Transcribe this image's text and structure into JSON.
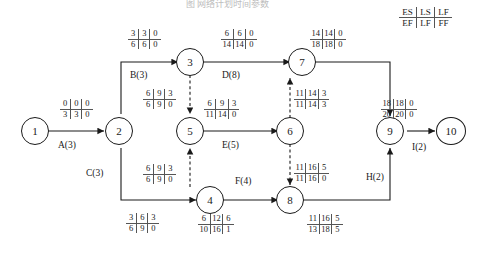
{
  "title": "图 网络计划时间参数",
  "legend": {
    "name": "time-parameter-legend",
    "top": [
      "ES",
      "LS",
      "LF"
    ],
    "bottom": [
      "EF",
      "LF",
      "FF"
    ]
  },
  "nodes": [
    {
      "id": "1",
      "label": "1"
    },
    {
      "id": "2",
      "label": "2"
    },
    {
      "id": "3",
      "label": "3"
    },
    {
      "id": "4",
      "label": "4"
    },
    {
      "id": "5",
      "label": "5"
    },
    {
      "id": "6",
      "label": "6"
    },
    {
      "id": "7",
      "label": "7"
    },
    {
      "id": "8",
      "label": "8"
    },
    {
      "id": "9",
      "label": "9"
    },
    {
      "id": "10",
      "label": "10"
    }
  ],
  "activities": [
    {
      "key": "A",
      "label": "A(3)"
    },
    {
      "key": "B",
      "label": "B(3)"
    },
    {
      "key": "C",
      "label": "C(3)"
    },
    {
      "key": "D",
      "label": "D(8)"
    },
    {
      "key": "E",
      "label": "E(5)"
    },
    {
      "key": "F",
      "label": "F(4)"
    },
    {
      "key": "H",
      "label": "H(2)"
    },
    {
      "key": "I",
      "label": "I(2)"
    }
  ],
  "boxes": [
    {
      "key": "A",
      "top": [
        "0",
        "0",
        "0"
      ],
      "bottom": [
        "3",
        "3",
        "0"
      ]
    },
    {
      "key": "B",
      "top": [
        "3",
        "3",
        "0"
      ],
      "bottom": [
        "6",
        "6",
        "0"
      ]
    },
    {
      "key": "D",
      "top": [
        "6",
        "6",
        "0"
      ],
      "bottom": [
        "14",
        "14",
        "0"
      ]
    },
    {
      "key": "G",
      "top": [
        "14",
        "14",
        "0"
      ],
      "bottom": [
        "18",
        "18",
        "0"
      ]
    },
    {
      "key": "d35",
      "top": [
        "6",
        "9",
        "3"
      ],
      "bottom": [
        "6",
        "9",
        "0"
      ]
    },
    {
      "key": "E",
      "top": [
        "6",
        "9",
        "3"
      ],
      "bottom": [
        "11",
        "14",
        "0"
      ]
    },
    {
      "key": "d67",
      "top": [
        "11",
        "14",
        "3"
      ],
      "bottom": [
        "11",
        "14",
        "3"
      ]
    },
    {
      "key": "I",
      "top": [
        "18",
        "18",
        "0"
      ],
      "bottom": [
        "20",
        "20",
        "0"
      ]
    },
    {
      "key": "d45",
      "top": [
        "6",
        "9",
        "3"
      ],
      "bottom": [
        "6",
        "9",
        "0"
      ]
    },
    {
      "key": "d68",
      "top": [
        "11",
        "16",
        "5"
      ],
      "bottom": [
        "11",
        "16",
        "0"
      ]
    },
    {
      "key": "C",
      "top": [
        "3",
        "6",
        "3"
      ],
      "bottom": [
        "6",
        "9",
        "0"
      ]
    },
    {
      "key": "F",
      "top": [
        "6",
        "12",
        "6"
      ],
      "bottom": [
        "10",
        "16",
        "1"
      ]
    },
    {
      "key": "H",
      "top": [
        "11",
        "16",
        "5"
      ],
      "bottom": [
        "13",
        "18",
        "5"
      ]
    }
  ]
}
